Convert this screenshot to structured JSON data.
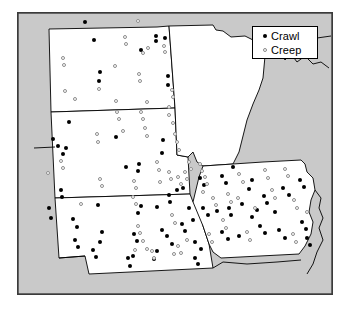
{
  "figure": {
    "type": "dot-distribution-map",
    "region": "Upper Midwest United States",
    "width": 349,
    "height": 310,
    "background_color": "#ffffff",
    "outside_fill": "#c9c9c9",
    "state_fill": "#ffffff",
    "border_color": "#000000"
  },
  "legend": {
    "name": "map-legend",
    "position": "top-right",
    "items": [
      {
        "label": "Crawl",
        "symbol": "filled-circle",
        "color": "#000000"
      },
      {
        "label": "Creep",
        "symbol": "open-circle",
        "color": "#8a8a8a"
      }
    ]
  },
  "chart_data": {
    "type": "scatter",
    "title": "",
    "xlabel": "",
    "ylabel": "",
    "xlim": [
      0,
      316
    ],
    "ylim": [
      0,
      283
    ],
    "grid": false,
    "legend_position": "top-right",
    "categories": [
      "Crawl",
      "Creep"
    ],
    "series": [
      {
        "name": "Crawl",
        "marker": "filled-circle",
        "color": "#000000",
        "points": [
          [
            68,
            10
          ],
          [
            77,
            28
          ],
          [
            139,
            29
          ],
          [
            124,
            38
          ],
          [
            139,
            24
          ],
          [
            148,
            26
          ],
          [
            83,
            60
          ],
          [
            151,
            64
          ],
          [
            151,
            73
          ],
          [
            82,
            69
          ],
          [
            52,
            110
          ],
          [
            99,
            125
          ],
          [
            145,
            141
          ],
          [
            146,
            128
          ],
          [
            36,
            127
          ],
          [
            41,
            134
          ],
          [
            46,
            142
          ],
          [
            49,
            136
          ],
          [
            109,
            155
          ],
          [
            121,
            159
          ],
          [
            122,
            152
          ],
          [
            44,
            178
          ],
          [
            45,
            185
          ],
          [
            32,
            196
          ],
          [
            34,
            206
          ],
          [
            56,
            207
          ],
          [
            60,
            215
          ],
          [
            81,
            193
          ],
          [
            85,
            220
          ],
          [
            124,
            194
          ],
          [
            121,
            201
          ],
          [
            117,
            222
          ],
          [
            120,
            229
          ],
          [
            76,
            238
          ],
          [
            79,
            245
          ],
          [
            83,
            230
          ],
          [
            116,
            244
          ],
          [
            152,
            183
          ],
          [
            153,
            190
          ],
          [
            140,
            195
          ],
          [
            160,
            178
          ],
          [
            166,
            176
          ],
          [
            172,
            196
          ],
          [
            176,
            208
          ],
          [
            165,
            212
          ],
          [
            168,
            219
          ],
          [
            178,
            230
          ],
          [
            184,
            237
          ],
          [
            145,
            218
          ],
          [
            150,
            224
          ],
          [
            155,
            232
          ],
          [
            183,
            166
          ],
          [
            187,
            173
          ],
          [
            205,
            164
          ],
          [
            209,
            171
          ],
          [
            216,
            155
          ],
          [
            232,
            177
          ],
          [
            235,
            168
          ],
          [
            186,
            196
          ],
          [
            191,
            203
          ],
          [
            200,
            199
          ],
          [
            212,
            196
          ],
          [
            214,
            203
          ],
          [
            225,
            192
          ],
          [
            247,
            184
          ],
          [
            250,
            191
          ],
          [
            258,
            200
          ],
          [
            235,
            205
          ],
          [
            240,
            198
          ],
          [
            266,
            176
          ],
          [
            272,
            183
          ],
          [
            283,
            168
          ],
          [
            287,
            175
          ],
          [
            205,
            220
          ],
          [
            211,
            227
          ],
          [
            222,
            224
          ],
          [
            243,
            214
          ],
          [
            248,
            221
          ],
          [
            262,
            218
          ],
          [
            268,
            226
          ],
          [
            285,
            210
          ],
          [
            289,
            217
          ],
          [
            290,
            226
          ],
          [
            293,
            233
          ],
          [
            111,
            246
          ],
          [
            113,
            254
          ],
          [
            137,
            247
          ],
          [
            140,
            239
          ],
          [
            178,
            246
          ],
          [
            181,
            252
          ],
          [
            58,
            228
          ],
          [
            61,
            235
          ]
        ]
      },
      {
        "name": "Creep",
        "marker": "open-circle",
        "color": "#8d8d8d",
        "points": [
          [
            121,
            9
          ],
          [
            108,
            25
          ],
          [
            109,
            32
          ],
          [
            126,
            41
          ],
          [
            131,
            36
          ],
          [
            46,
            46
          ],
          [
            47,
            53
          ],
          [
            98,
            54
          ],
          [
            82,
            77
          ],
          [
            48,
            79
          ],
          [
            58,
            87
          ],
          [
            99,
            89
          ],
          [
            130,
            90
          ],
          [
            122,
            62
          ],
          [
            123,
            69
          ],
          [
            147,
            34
          ],
          [
            148,
            40
          ],
          [
            155,
            78
          ],
          [
            156,
            85
          ],
          [
            152,
            95
          ],
          [
            100,
            100
          ],
          [
            102,
            107
          ],
          [
            124,
            100
          ],
          [
            126,
            107
          ],
          [
            152,
            103
          ],
          [
            156,
            111
          ],
          [
            80,
            122
          ],
          [
            81,
            130
          ],
          [
            158,
            122
          ],
          [
            160,
            130
          ],
          [
            162,
            138
          ],
          [
            44,
            149
          ],
          [
            46,
            156
          ],
          [
            31,
            161
          ],
          [
            128,
            116
          ],
          [
            130,
            124
          ],
          [
            106,
            119
          ],
          [
            140,
            150
          ],
          [
            142,
            158
          ],
          [
            83,
            167
          ],
          [
            85,
            174
          ],
          [
            117,
            169
          ],
          [
            119,
            176
          ],
          [
            116,
            185
          ],
          [
            119,
            192
          ],
          [
            152,
            160
          ],
          [
            154,
            167
          ],
          [
            143,
            170
          ],
          [
            121,
            214
          ],
          [
            123,
            221
          ],
          [
            126,
            229
          ],
          [
            130,
            237
          ],
          [
            118,
            238
          ],
          [
            155,
            203
          ],
          [
            158,
            211
          ],
          [
            161,
            165
          ],
          [
            164,
            172
          ],
          [
            168,
            160
          ],
          [
            170,
            167
          ],
          [
            172,
            150
          ],
          [
            174,
            157
          ],
          [
            183,
            152
          ],
          [
            185,
            159
          ],
          [
            161,
            234
          ],
          [
            164,
            241
          ],
          [
            188,
            165
          ],
          [
            190,
            172
          ],
          [
            196,
            186
          ],
          [
            199,
            193
          ],
          [
            186,
            180
          ],
          [
            222,
            162
          ],
          [
            226,
            170
          ],
          [
            211,
            182
          ],
          [
            214,
            190
          ],
          [
            248,
            158
          ],
          [
            251,
            166
          ],
          [
            268,
            157
          ],
          [
            271,
            164
          ],
          [
            255,
            178
          ],
          [
            258,
            186
          ],
          [
            221,
            186
          ],
          [
            238,
            196
          ],
          [
            277,
            188
          ],
          [
            280,
            196
          ],
          [
            206,
            208
          ],
          [
            209,
            216
          ],
          [
            230,
            220
          ],
          [
            233,
            228
          ],
          [
            290,
            200
          ],
          [
            135,
            239
          ],
          [
            137,
            246
          ],
          [
            276,
            222
          ],
          [
            279,
            230
          ],
          [
            192,
            222
          ],
          [
            195,
            230
          ],
          [
            170,
            228
          ],
          [
            157,
            242
          ],
          [
            64,
            192
          ]
        ]
      }
    ]
  }
}
